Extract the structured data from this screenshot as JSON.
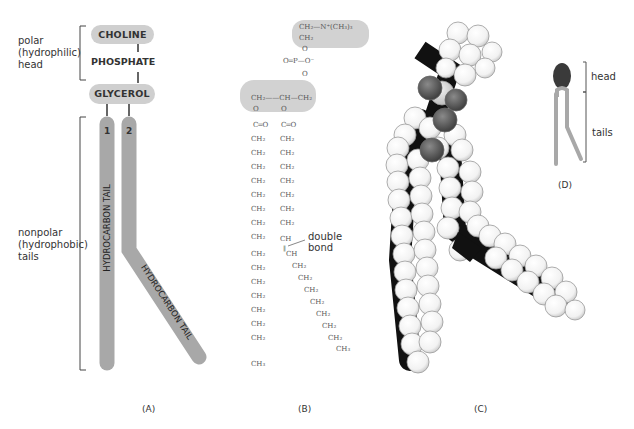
{
  "panel_a": {
    "label": "(A)",
    "head_label_lines": [
      "polar",
      "(hydrophilic)",
      "head"
    ],
    "tail_label_lines": [
      "nonpolar",
      "(hydrophobic)",
      "tails"
    ],
    "choline": "CHOLINE",
    "phosphate": "PHOSPHATE",
    "glycerol": "GLYCEROL",
    "tail1_number": "1",
    "tail2_number": "2",
    "tail1_text": "HYDROCARBON TAIL",
    "tail2_text": "HYDROCARBON TAIL"
  },
  "panel_b": {
    "label": "(B)",
    "choline_group": "CH₂—N⁺(CH₃)₃",
    "choline_ch2": "CH₂",
    "o1": "O",
    "phosphate": "O═P—O⁻",
    "o2": "O",
    "glycerol": "CH₂——CH—CH₂",
    "ester_o": "O",
    "carbonyl": "C═O",
    "ch2": "CH₂",
    "ch": "CH",
    "ch3": "CH₃",
    "double_bond_label_lines": [
      "double",
      "bond"
    ]
  },
  "panel_c": {
    "label": "(C)"
  },
  "panel_d": {
    "label": "(D)",
    "head_label": "head",
    "tails_label": "tails"
  },
  "colors": {
    "pill_gray": "#cfcfcf",
    "tail_gray": "#a8a8a8",
    "head_dark": "#3a3a3a",
    "oxygen": "#5a5a5a",
    "phosphorus": "#dcdcdc"
  }
}
